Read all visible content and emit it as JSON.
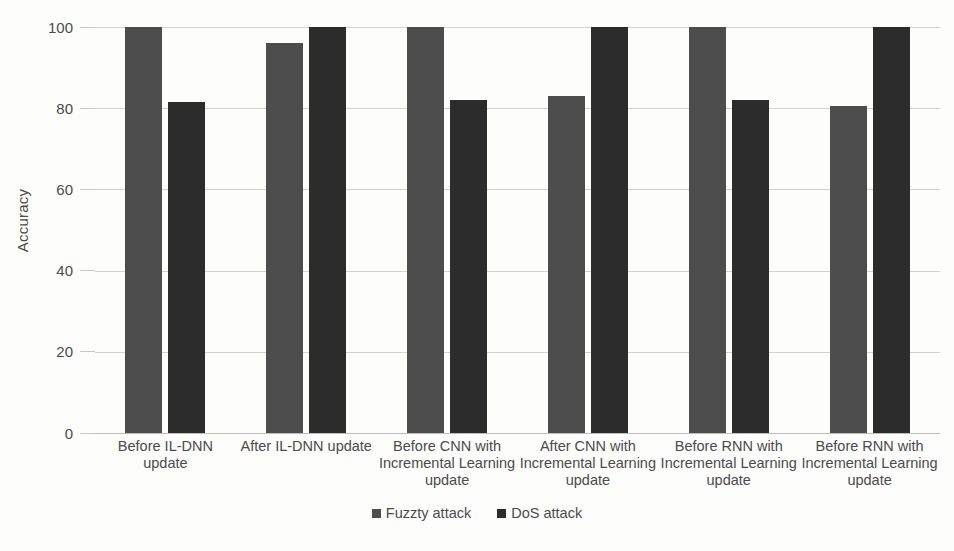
{
  "chart_data": {
    "type": "bar",
    "title": "",
    "xlabel": "",
    "ylabel": "Accuracy",
    "ylim": [
      0,
      100
    ],
    "yticks": [
      0,
      20,
      40,
      60,
      80,
      100
    ],
    "grid": true,
    "legend_position": "bottom",
    "categories": [
      "Before IL-DNN update",
      "After IL-DNN update",
      "Before CNN with Incremental Learning update",
      "After CNN  with Incremental Learning update",
      "Before RNN  with Incremental Learning update",
      "Before RNN  with Incremental Learning update"
    ],
    "series": [
      {
        "name": "Fuzzty attack",
        "color": "#4d4d4d",
        "values": [
          100,
          96,
          100,
          83,
          100,
          80.5
        ]
      },
      {
        "name": "DoS attack",
        "color": "#2c2c2c",
        "values": [
          81.5,
          100,
          82,
          100,
          82,
          100
        ]
      }
    ]
  },
  "axis": {
    "y_title": "Accuracy",
    "tick_labels": [
      "100",
      "80",
      "60",
      "40",
      "20",
      "0"
    ]
  },
  "legend": {
    "items": [
      {
        "label": "Fuzzty attack"
      },
      {
        "label": "DoS attack"
      }
    ]
  }
}
